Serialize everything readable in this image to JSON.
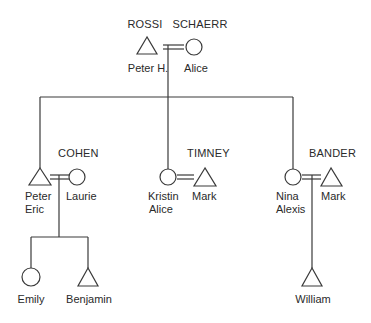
{
  "diagram": {
    "type": "genealogy",
    "colors": {
      "line": "#3a3a3a",
      "text": "#2a2a2a",
      "background": "#ffffff"
    },
    "legend_symbols": {
      "male": "triangle",
      "female": "circle",
      "marriage": "double-line"
    },
    "generation1": {
      "husband": {
        "surname": "ROSSI",
        "name": "Peter H.",
        "symbol": "triangle"
      },
      "wife": {
        "surname": "SCHAERR",
        "name": "Alice",
        "symbol": "circle"
      }
    },
    "generation2": [
      {
        "family_surname": "COHEN",
        "child": {
          "name_line1": "Peter",
          "name_line2": "Eric",
          "symbol": "triangle"
        },
        "spouse": {
          "name": "Laurie",
          "symbol": "circle"
        },
        "children": [
          {
            "name": "Emily",
            "symbol": "circle"
          },
          {
            "name": "Benjamin",
            "symbol": "triangle"
          }
        ]
      },
      {
        "family_surname": "TIMNEY",
        "child": {
          "name_line1": "Kristin",
          "name_line2": "Alice",
          "symbol": "circle"
        },
        "spouse": {
          "name": "Mark",
          "symbol": "triangle"
        },
        "children": []
      },
      {
        "family_surname": "BANDER",
        "child": {
          "name_line1": "Nina",
          "name_line2": "Alexis",
          "symbol": "circle"
        },
        "spouse": {
          "name": "Mark",
          "symbol": "triangle"
        },
        "children": [
          {
            "name": "William",
            "symbol": "triangle"
          }
        ]
      }
    ]
  }
}
